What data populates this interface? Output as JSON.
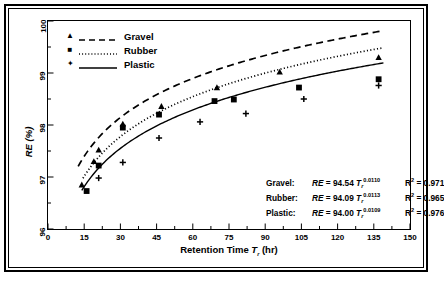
{
  "figure": {
    "caption": ""
  },
  "chart_data": {
    "type": "line",
    "title": "",
    "xlabel": "Retention Time T r (hr)",
    "ylabel": "RE (%)",
    "xlim": [
      0,
      150
    ],
    "ylim": [
      96,
      100
    ],
    "xticks": [
      "0",
      "15",
      "30",
      "45",
      "60",
      "75",
      "90",
      "105",
      "120",
      "135",
      "150"
    ],
    "yticks": [
      "96",
      "97",
      "98",
      "99",
      "100"
    ],
    "xtick_step": 15,
    "ytick_step": 1,
    "minor_ticks": true,
    "grid": false,
    "legend_position": "upper-left-inside",
    "series": [
      {
        "name": "Gravel",
        "marker": "triangle",
        "linestyle": "dashed",
        "color": "#000000",
        "points": [
          {
            "x": 14.0,
            "y": 96.85
          },
          {
            "x": 19.0,
            "y": 97.3
          },
          {
            "x": 21.0,
            "y": 97.52
          },
          {
            "x": 31.0,
            "y": 98.02
          },
          {
            "x": 47.0,
            "y": 98.36
          },
          {
            "x": 70.0,
            "y": 98.72
          },
          {
            "x": 96.0,
            "y": 99.02
          },
          {
            "x": 137.0,
            "y": 99.3
          }
        ]
      },
      {
        "name": "Rubber",
        "marker": "square",
        "linestyle": "dotted",
        "color": "#000000",
        "points": [
          {
            "x": 16.0,
            "y": 96.73
          },
          {
            "x": 21.0,
            "y": 97.22
          },
          {
            "x": 31.0,
            "y": 97.95
          },
          {
            "x": 46.0,
            "y": 98.2
          },
          {
            "x": 69.0,
            "y": 98.46
          },
          {
            "x": 77.0,
            "y": 98.49
          },
          {
            "x": 104.0,
            "y": 98.72
          },
          {
            "x": 137.0,
            "y": 98.88
          }
        ]
      },
      {
        "name": "Plastic",
        "marker": "plus",
        "linestyle": "solid",
        "color": "#000000",
        "points": [
          {
            "x": 21.0,
            "y": 96.98
          },
          {
            "x": 31.0,
            "y": 97.28
          },
          {
            "x": 46.0,
            "y": 97.75
          },
          {
            "x": 63.0,
            "y": 98.06
          },
          {
            "x": 82.0,
            "y": 98.22
          },
          {
            "x": 106.0,
            "y": 98.5
          },
          {
            "x": 137.0,
            "y": 98.76
          }
        ]
      }
    ],
    "fits": [
      {
        "label": "Gravel:",
        "coefficient": "94.54",
        "exponent": "0.0110",
        "r2": "0.971"
      },
      {
        "label": "Rubber:",
        "coefficient": "94.09",
        "exponent": "0.0113",
        "r2": "0.965"
      },
      {
        "label": "Plastic:",
        "coefficient": "94.00",
        "exponent": "0.0109",
        "r2": "0.976"
      }
    ],
    "equation_prefix": "RE",
    "equation_eq": "=",
    "equation_var": "T",
    "equation_sub": "r",
    "r2_symbol": "R",
    "r2_exp": "2",
    "r2_eq": "="
  },
  "legend": {
    "items": [
      {
        "label": "Gravel",
        "marker": "▲"
      },
      {
        "label": "Rubber",
        "marker": "■"
      },
      {
        "label": "Plastic",
        "marker": "✦"
      }
    ]
  },
  "axis": {
    "ylabel_main": "RE",
    "ylabel_unit": " (%)",
    "xlabel_main": "Retention Time ",
    "xlabel_var": "T",
    "xlabel_sub": "r",
    "xlabel_unit": " (hr)"
  }
}
